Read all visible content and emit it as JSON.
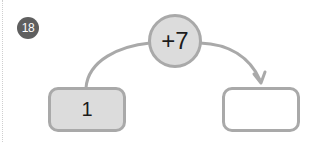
{
  "problem": {
    "number": "18"
  },
  "operation": {
    "label": "+7"
  },
  "start_box": {
    "value": "1"
  },
  "result_box": {
    "value": ""
  },
  "colors": {
    "badge": "#5f5f5f",
    "circle_fill": "#dcdcdc",
    "stroke": "#a9a9a9",
    "start_fill": "#dcdcdc",
    "result_fill": "#ffffff"
  }
}
